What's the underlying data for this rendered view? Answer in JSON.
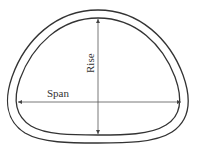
{
  "diagram": {
    "type": "tunnel-cross-section",
    "shape": "horseshoe / egg-shaped arch with flat-ish invert",
    "labels": {
      "span": "Span",
      "rise": "Rise"
    },
    "colors": {
      "stroke": "#333333",
      "dimension_line": "#555555",
      "background": "#ffffff"
    }
  }
}
